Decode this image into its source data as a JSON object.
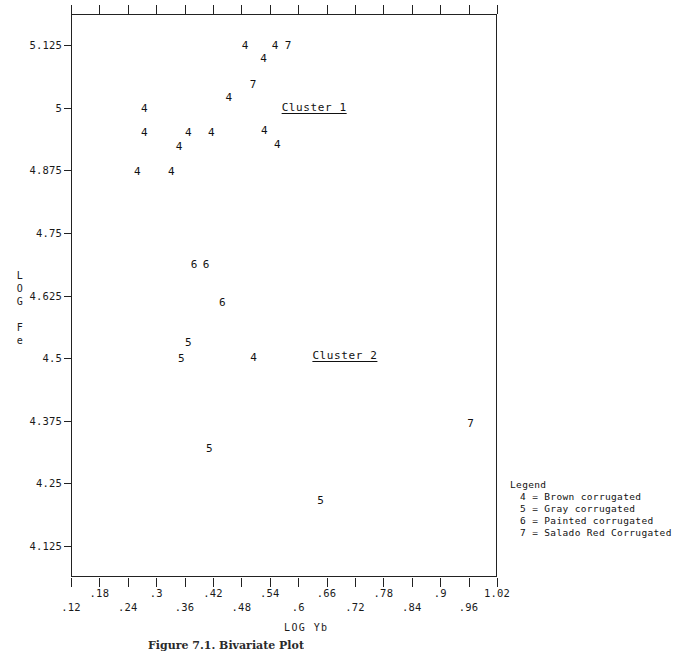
{
  "figure": {
    "caption": "Figure 7.1. Bivariate Plot",
    "x_axis_title": "LOG Yb",
    "y_axis_title_chars": [
      "L",
      "O",
      "G",
      "",
      "F",
      "e"
    ]
  },
  "annotations": [
    {
      "text": "Cluster 1",
      "x": 0.565,
      "y": 5.0
    },
    {
      "text": "Cluster 2",
      "x": 0.63,
      "y": 4.505
    }
  ],
  "legend": {
    "title": "Legend",
    "entries": [
      "4 = Brown corrugated",
      "5 = Gray corrugated",
      "6 = Painted corrugated",
      "7 = Salado Red Corrugated"
    ]
  },
  "chart_data": {
    "type": "scatter",
    "title": "Figure 7.1. Bivariate Plot",
    "xlabel": "LOG Yb",
    "ylabel": "LOG Fe",
    "xlim": [
      0.12,
      1.02
    ],
    "ylim": [
      4.0625,
      5.1875
    ],
    "grid": false,
    "legend_position": "outside-right-bottom",
    "xticks": [
      0.12,
      0.18,
      0.24,
      0.3,
      0.36,
      0.42,
      0.48,
      0.54,
      0.6,
      0.66,
      0.72,
      0.78,
      0.84,
      0.9,
      0.96,
      1.02
    ],
    "xticklabels": [
      ".12",
      ".18",
      ".24",
      ".3",
      ".36",
      ".42",
      ".48",
      ".54",
      ".6",
      ".66",
      ".72",
      ".78",
      ".84",
      ".9",
      ".96",
      "1.02"
    ],
    "yticks": [
      4.125,
      4.25,
      4.375,
      4.5,
      4.625,
      4.75,
      4.875,
      5.0,
      5.125
    ],
    "yticklabels": [
      "4.125",
      "4.25",
      "4.375",
      "4.5",
      "4.625",
      "4.75",
      "4.875",
      "5",
      "5.125"
    ],
    "series": [
      {
        "name": "Brown corrugated",
        "marker": "4",
        "points": [
          {
            "x": 0.4875,
            "y": 5.1262
          },
          {
            "x": 0.551,
            "y": 5.1262
          },
          {
            "x": 0.527,
            "y": 5.0996
          },
          {
            "x": 0.4535,
            "y": 5.0217
          },
          {
            "x": 0.275,
            "y": 5.0002
          },
          {
            "x": 0.5285,
            "y": 4.9551
          },
          {
            "x": 0.275,
            "y": 4.951
          },
          {
            "x": 0.368,
            "y": 4.951
          },
          {
            "x": 0.4165,
            "y": 4.951
          },
          {
            "x": 0.556,
            "y": 4.9285
          },
          {
            "x": 0.3485,
            "y": 4.9244
          },
          {
            "x": 0.26,
            "y": 4.8732
          },
          {
            "x": 0.332,
            "y": 4.8732
          },
          {
            "x": 0.5055,
            "y": 4.5026
          }
        ]
      },
      {
        "name": "Gray corrugated",
        "marker": "5",
        "points": [
          {
            "x": 0.368,
            "y": 4.5313
          },
          {
            "x": 0.353,
            "y": 4.5006
          },
          {
            "x": 0.412,
            "y": 4.3212
          },
          {
            "x": 0.647,
            "y": 4.2168
          }
        ]
      },
      {
        "name": "Painted corrugated",
        "marker": "6",
        "points": [
          {
            "x": 0.38,
            "y": 4.687
          },
          {
            "x": 0.4055,
            "y": 4.687
          },
          {
            "x": 0.4395,
            "y": 4.6112
          }
        ]
      },
      {
        "name": "Salado Red Corrugated",
        "marker": "7",
        "points": [
          {
            "x": 0.5785,
            "y": 5.1262
          },
          {
            "x": 0.5045,
            "y": 5.0484
          },
          {
            "x": 0.964,
            "y": 4.3704
          }
        ]
      }
    ]
  }
}
